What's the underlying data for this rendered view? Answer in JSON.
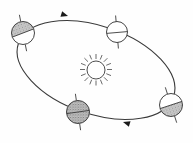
{
  "figure": {
    "title": "Earth's Orbit Around the Sun",
    "background_color": "#fefefe",
    "line_color": "#3a3a3a",
    "shade_color": "#9b9b9b",
    "unshaded_color": "#ffffff",
    "width": 193,
    "height": 143
  },
  "sun": {
    "label": "sun",
    "center_x": 96,
    "center_y": 70,
    "radius": 9,
    "ray_count": 16,
    "ray_inner": 11,
    "ray_outer": 16,
    "color": "#3a3a3a"
  },
  "orbit": {
    "label": "orbital-path",
    "center_x": 96,
    "center_y": 70,
    "radius_x": 82,
    "radius_y": 44,
    "rotation_deg": 19,
    "stroke_width": 1.1,
    "color": "#3a3a3a",
    "direction": "counterclockwise"
  },
  "arrows": [
    {
      "name": "orbit-arrow-top",
      "x": 72,
      "y": 16,
      "angle_deg": 197,
      "size": 7
    },
    {
      "name": "orbit-arrow-bottom",
      "x": 119,
      "y": 122,
      "angle_deg": 17,
      "size": 7
    }
  ],
  "earths": [
    {
      "name": "earth-left",
      "position_label": "left",
      "season": "northern-hemisphere-tilted-toward-sun",
      "center_x": 23,
      "center_y": 33,
      "radius": 11.5,
      "axis_tilt_deg": -21,
      "axis_overhang": 7,
      "shading": "upper-left",
      "shade_fill": "#9e9e9e",
      "equator_visible": true
    },
    {
      "name": "earth-top",
      "position_label": "top",
      "season": "unshaded",
      "center_x": 117,
      "center_y": 32,
      "radius": 10.5,
      "axis_tilt_deg": -5,
      "axis_overhang": 6,
      "shading": "none",
      "shade_fill": "#ffffff",
      "equator_visible": true
    },
    {
      "name": "earth-bottom",
      "position_label": "bottom",
      "season": "fully-shaded",
      "center_x": 78,
      "center_y": 112,
      "radius": 11.5,
      "axis_tilt_deg": -8,
      "axis_overhang": 7,
      "shading": "full",
      "shade_fill": "#a6a6a6",
      "equator_visible": true
    },
    {
      "name": "earth-right",
      "position_label": "right",
      "season": "southern-hemisphere-tilted-toward-sun",
      "center_x": 171,
      "center_y": 105,
      "radius": 11.5,
      "axis_tilt_deg": -18,
      "axis_overhang": 7,
      "shading": "lower-right",
      "shade_fill": "#9e9e9e",
      "equator_visible": true
    }
  ]
}
